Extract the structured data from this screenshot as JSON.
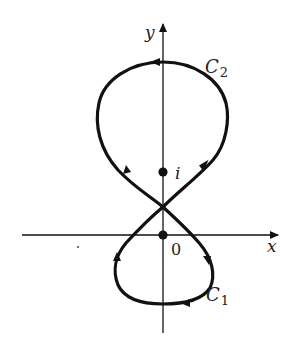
{
  "diagram": {
    "type": "complex-plane contour (figure-eight)",
    "axes": {
      "x_label": "x",
      "y_label": "y"
    },
    "points": [
      {
        "label": "i",
        "name": "point-i"
      },
      {
        "label": "0",
        "name": "origin"
      }
    ],
    "curves": [
      {
        "label_main": "C",
        "label_sub": "2",
        "name": "upper loop",
        "orientation": "counterclockwise"
      },
      {
        "label_main": "C",
        "label_sub": "1",
        "name": "lower loop",
        "orientation": "clockwise"
      }
    ],
    "colors": {
      "stroke": "#111111",
      "background": "#ffffff"
    }
  }
}
